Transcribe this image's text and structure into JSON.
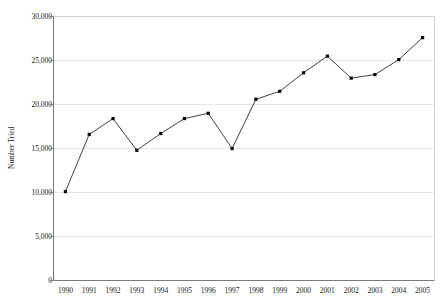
{
  "figure": {
    "top_caption": "",
    "background_color": "#ffffff"
  },
  "chart_data": {
    "type": "line",
    "title": "",
    "subtitle": "",
    "xlabel": "",
    "ylabel": "Number Tried",
    "categories": [
      "1990",
      "1991",
      "1992",
      "1993",
      "1994",
      "1995",
      "1996",
      "1997",
      "1998",
      "1999",
      "2000",
      "2001",
      "2002",
      "2003",
      "2004",
      "2005"
    ],
    "values": [
      10100,
      16600,
      18400,
      14800,
      16700,
      18400,
      19000,
      15000,
      20600,
      21500,
      23600,
      25500,
      23000,
      23400,
      25100,
      27600
    ],
    "series": [
      {
        "name": "Number Tried",
        "values": [
          10100,
          16600,
          18400,
          14800,
          16700,
          18400,
          19000,
          15000,
          20600,
          21500,
          23600,
          25500,
          23000,
          23400,
          25100,
          27600
        ]
      }
    ],
    "ylim": [
      0,
      30000
    ],
    "yticks": [
      0,
      5000,
      10000,
      15000,
      20000,
      25000,
      30000
    ],
    "ytick_labels": [
      "0",
      "5,000",
      "10,000",
      "15,000",
      "20,000",
      "25,000",
      "30,000"
    ],
    "xtick_labels": [
      "1990",
      "1991",
      "1992",
      "1993",
      "1994",
      "1995",
      "1996",
      "1997",
      "1998",
      "1999",
      "2000",
      "2001",
      "2002",
      "2003",
      "2004",
      "2005"
    ],
    "grid": "horizontal",
    "legend": "none",
    "line_color": "#2b2b2b",
    "marker_color": "#000000",
    "marker_shape": "square",
    "axis_color": "#7a7a7a",
    "gridline_color": "#e8e8ec",
    "annotations": []
  },
  "axes": {
    "y_title": "Number Tried",
    "y_ticks": [
      {
        "label": "30,000",
        "value": 30000
      },
      {
        "label": "25,000",
        "value": 25000
      },
      {
        "label": "20,000",
        "value": 20000
      },
      {
        "label": "15,000",
        "value": 15000
      },
      {
        "label": "10,000",
        "value": 10000
      },
      {
        "label": "5,000",
        "value": 5000
      },
      {
        "label": "0",
        "value": 0
      }
    ],
    "x_ticks": [
      {
        "label": "1990"
      },
      {
        "label": "1991"
      },
      {
        "label": "1992"
      },
      {
        "label": "1993"
      },
      {
        "label": "1994"
      },
      {
        "label": "1995"
      },
      {
        "label": "1996"
      },
      {
        "label": "1997"
      },
      {
        "label": "1998"
      },
      {
        "label": "1999"
      },
      {
        "label": "2000"
      },
      {
        "label": "2001"
      },
      {
        "label": "2002"
      },
      {
        "label": "2003"
      },
      {
        "label": "2004"
      },
      {
        "label": "2005"
      }
    ]
  }
}
